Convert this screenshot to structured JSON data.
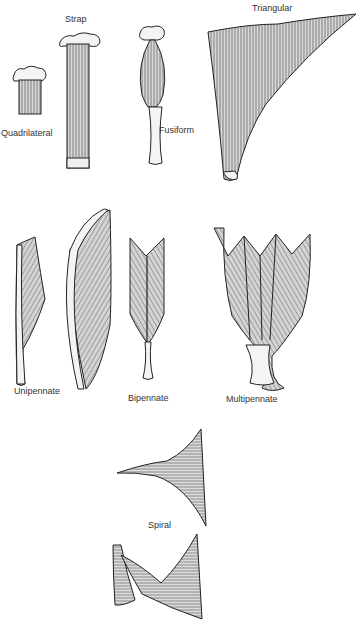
{
  "diagram": {
    "labels": {
      "strap": "Strap",
      "quadrilateral": "Quadrilateral",
      "fusiform": "Fusiform",
      "triangular": "Triangular",
      "unipennate": "Unipennate",
      "bipennate": "Bipennate",
      "multipennate": "Multipennate",
      "spiral": "Spiral"
    },
    "colors": {
      "outline": "#222222",
      "fibre": "#777777",
      "fill": "#cfcfcf",
      "tendon": "#f4f4f4"
    }
  }
}
